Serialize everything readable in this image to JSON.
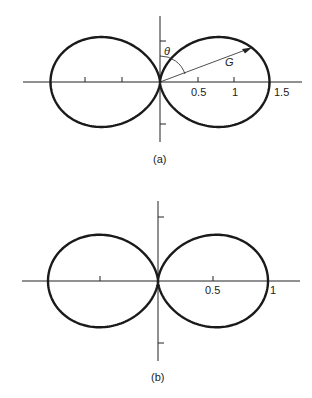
{
  "chart_data": [
    {
      "type": "polar-line",
      "caption": "(a)",
      "title": "",
      "series": [
        {
          "name": "G(θ)",
          "formula_hint": "figure-eight radiation pattern, max 1.5 along horizontal axis",
          "max_value": 1.5
        }
      ],
      "x_ticks": [
        "0.5",
        "1",
        "1.5"
      ],
      "annotations": {
        "angle_label": "θ",
        "vector_label": "G"
      },
      "xlim": [
        -1.55,
        1.9
      ]
    },
    {
      "type": "polar-line",
      "caption": "(b)",
      "title": "",
      "series": [
        {
          "name": "pattern",
          "formula_hint": "figure-eight radiation pattern, max 1 along horizontal axis",
          "max_value": 1.0
        }
      ],
      "x_ticks": [
        "0.5",
        "1"
      ],
      "xlim": [
        -1.25,
        1.3
      ]
    }
  ],
  "diagrams": {
    "a": {
      "caption": "(a)",
      "tick_labels": [
        "0.5",
        "1",
        "1.5"
      ],
      "theta_label": "θ",
      "g_label": "G",
      "amplitude": 1.5,
      "exponent": 1.7
    },
    "b": {
      "caption": "(b)",
      "tick_labels": [
        "0.5",
        "1"
      ],
      "amplitude": 1.0,
      "exponent": 1.6
    }
  }
}
